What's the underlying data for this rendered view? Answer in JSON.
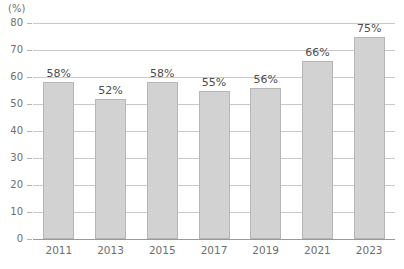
{
  "chart_data": {
    "type": "bar",
    "title": "",
    "subtitle": "",
    "xlabel": "",
    "ylabel": "",
    "unit_label": "(%)",
    "categories": [
      "2011",
      "2013",
      "2015",
      "2017",
      "2019",
      "2021",
      "2023"
    ],
    "values": [
      58,
      52,
      58,
      55,
      56,
      66,
      75
    ],
    "data_labels": [
      "58%",
      "52%",
      "58%",
      "55%",
      "56%",
      "66%",
      "75%"
    ],
    "ylim": [
      0,
      80
    ],
    "ytick_values": [
      0,
      10,
      20,
      30,
      40,
      50,
      60,
      70,
      80
    ],
    "ytick_labels": [
      "0",
      "10",
      "20",
      "30",
      "40",
      "50",
      "60",
      "70",
      "80"
    ],
    "grid": true,
    "grid_axis": "y",
    "legend": false,
    "legend_position": "none",
    "series": [
      {
        "name": "",
        "values": [
          58,
          52,
          58,
          55,
          56,
          66,
          75
        ]
      }
    ],
    "colors": {
      "bar_fill": "#d2d2d2",
      "bar_border": "#b6b6b6",
      "gridline": "#c9c9c9",
      "baseline": "#9a9a9a",
      "tick_text": "#6e6e6e",
      "value_text": "#4d4d4d",
      "background": "#ffffff"
    }
  }
}
